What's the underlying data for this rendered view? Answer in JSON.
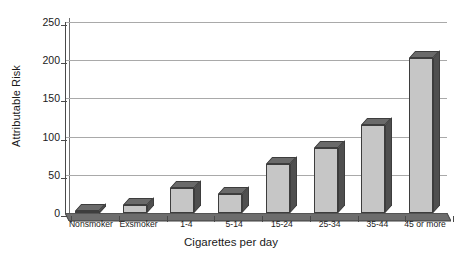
{
  "chart_data": {
    "type": "bar",
    "title": "",
    "xlabel": "Cigarettes per day",
    "ylabel": "Attributable Risk",
    "categories": [
      "Nonsmoker",
      "Exsmoker",
      "1-4",
      "5-14",
      "15-24",
      "25-34",
      "35-44",
      "45 or more"
    ],
    "values": [
      1,
      10,
      33,
      25,
      64,
      85,
      115,
      203
    ],
    "ylim": [
      0,
      250
    ],
    "yticks": [
      0,
      50,
      100,
      150,
      200,
      250
    ],
    "ytick_labels": [
      "0",
      "50",
      "100",
      "150",
      "200",
      "250"
    ],
    "grid": true,
    "legend": "none",
    "style": "3d-bar",
    "colors": {
      "bar_face": "#c6c6c6",
      "bar_side": "#4f4f4f",
      "bar_top": "#6a6a6a",
      "bar_outline": "#3d3d3d",
      "gridline": "#a9a9a9",
      "axis": "#4a4a4a",
      "plot_background": "#ffffff",
      "text": "#1a1a1a"
    }
  }
}
